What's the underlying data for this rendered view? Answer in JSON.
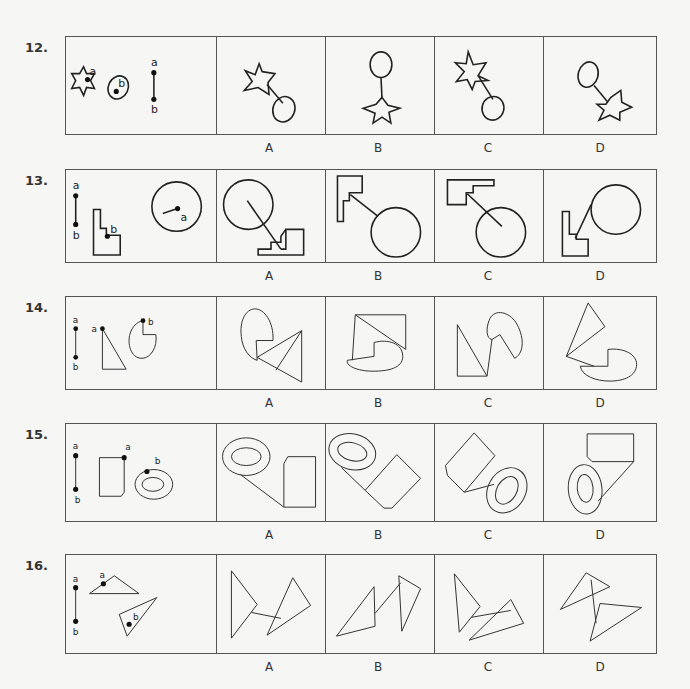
{
  "questions": [
    {
      "number": "12.",
      "options": [
        "A",
        "B",
        "C",
        "D"
      ],
      "given": {
        "shapes": [
          "six-point-star with point a",
          "oval with point b",
          "line segment a-b"
        ],
        "labels": [
          "a",
          "b",
          "a",
          "b"
        ]
      }
    },
    {
      "number": "13.",
      "options": [
        "A",
        "B",
        "C",
        "D"
      ],
      "given": {
        "shapes": [
          "line segment a-b",
          "stepped L-shape with point b",
          "circle with radius to point a"
        ],
        "labels": [
          "a",
          "b",
          "b",
          "a"
        ]
      }
    },
    {
      "number": "14.",
      "options": [
        "A",
        "B",
        "C",
        "D"
      ],
      "given": {
        "shapes": [
          "line segment a-b",
          "right triangle with point a",
          "pac-man oval with point b"
        ],
        "labels": [
          "a",
          "b",
          "a",
          "b"
        ]
      }
    },
    {
      "number": "15.",
      "options": [
        "A",
        "B",
        "C",
        "D"
      ],
      "given": {
        "shapes": [
          "line segment a-b",
          "clipped rectangle with point a",
          "double ring ellipse with point b"
        ],
        "labels": [
          "a",
          "b",
          "a",
          "b"
        ]
      }
    },
    {
      "number": "16.",
      "options": [
        "A",
        "B",
        "C",
        "D"
      ],
      "given": {
        "shapes": [
          "line segment a-b",
          "obtuse triangle with point a",
          "triangle with point b"
        ],
        "labels": [
          "a",
          "b",
          "a",
          "b"
        ]
      }
    }
  ],
  "colors": {
    "background": "#f6f6f5",
    "stroke": "#222222",
    "border": "#555555"
  }
}
